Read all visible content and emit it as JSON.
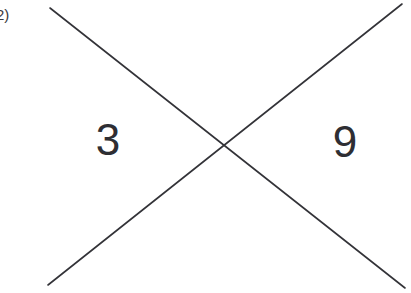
{
  "page": {
    "background_color": "#ffffff",
    "width": 411,
    "height": 293
  },
  "problem": {
    "number_label": "2)"
  },
  "diagram": {
    "type": "x-method-cross",
    "line_color": "#333338",
    "line_width": 1.6,
    "intersection": {
      "x": 228,
      "y": 144
    },
    "lines": [
      {
        "name": "descending-line",
        "x1": 50,
        "y1": 8,
        "x2": 405,
        "y2": 288
      },
      {
        "name": "ascending-line",
        "x1": 48,
        "y1": 285,
        "x2": 402,
        "y2": 4
      }
    ]
  },
  "values": {
    "left": "3",
    "right": "9",
    "top": "",
    "bottom": ""
  }
}
